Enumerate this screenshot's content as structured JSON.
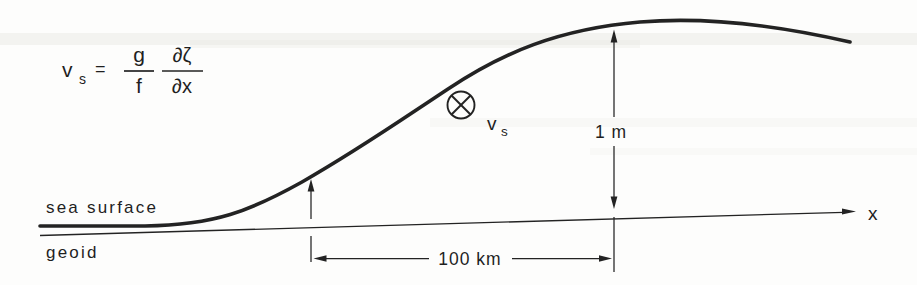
{
  "figure": {
    "colors": {
      "ink": "#232323",
      "background": "#fdfdfc"
    },
    "formula": {
      "variable": "v",
      "variable_sub": "s",
      "equals": "=",
      "numerator1": "g",
      "denominator1": "f",
      "numerator2": "∂ζ",
      "denominator2": "∂x"
    },
    "labels": {
      "sea_surface": "sea surface",
      "geoid": "geoid",
      "width_dim": "100 km",
      "height_dim": "1 m",
      "x_axis": "x",
      "velocity": "v",
      "velocity_sub": "s"
    },
    "symbols": {
      "into_page": "circle-with-x-into-page-vector"
    }
  }
}
